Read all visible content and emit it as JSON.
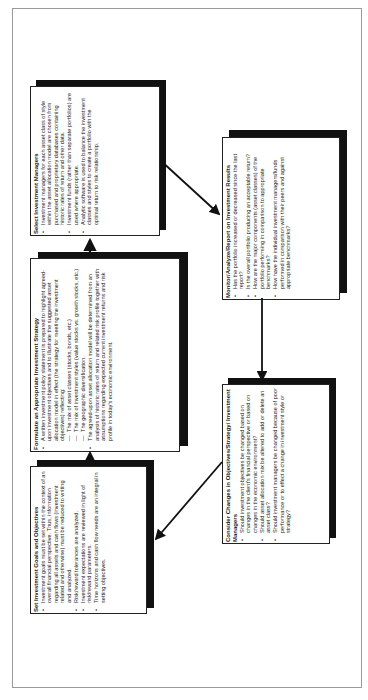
{
  "diagram": {
    "type": "investment-process-cycle",
    "boxes": {
      "select_managers": {
        "title": "Select Investment Managers",
        "bullets": [
          "Investment managers for each asset class of style within the asset allocation model are chosen from purchased and proprietary databases containing historic rates of return and other data.",
          "Investment funds (rather than separate portfolios) are used where appropriate.",
          "Analytic software is used to balance the investment classes and styles to create a portfolio with the optimal return to risk relationship."
        ]
      },
      "formulate_strategy": {
        "title": "Formulate an Appropriate Investment Strategy",
        "bullet1": "A written investment policy statement is prepared to highlight agreed-upon investment objectives and to illustrate the suggested asset allocation model in effect (the strategy for meeting the investment objectives) reflecting:",
        "sub_items": [
          "The mix of asset classes (stocks, bonds, etc.)",
          "The mix of investment styles (value stocks vs. growth stocks, etc.)",
          "The geographic diversification."
        ],
        "bullet2": "The agreed-upon asset allocation model will be determined from an analysis of historic rates of return and related risk profile together with assumptions regarding expected current investment returns and risk profile in today's economic environment."
      },
      "set_goals": {
        "title": "Set Investment Goals and Objectives",
        "bullets": [
          "Investment goals must be set within the context of an overall financial perspective. Thus, information regarding all assets and cash flows (investment related and otherwise) must be reduced to writing and analyzed.",
          "Risk/reward tolerances are analyzed.",
          "Investment expectations are reviewed in light of risk/reward parameters.",
          "Time horizons and cash flow needs are an integral in setting objectives."
        ]
      },
      "monitor": {
        "title": "Monitor/Analyze/Report on Investment Results",
        "bullets": [
          "Has the portfolio increased or decreased since the last report?",
          "Is the overall portfolio producing an acceptable return?",
          "How are the major components (asset classes) of the portfolio performing in comparison to appropriate benchmarks?",
          "How have the individual investment managers/funds performed in comparison with their peers and against appropriate benchmarks?"
        ]
      },
      "consider_changes": {
        "title": "Consider Changes in Objectives/Strategy/ Investment Managers",
        "bullets": [
          "Should investment objectives be changed based on changes in the client's financial perspective or based on changes in the economic environment?",
          "Should asset allocation mix be altered to add or delete an asset class?",
          "Should investment managers be changed because of poor performance or to effect a change in investment style or strategy?"
        ]
      }
    },
    "flow": [
      "Set Investment Goals and Objectives",
      "Formulate an Appropriate Investment Strategy",
      "Select Investment Managers",
      "Monitor/Analyze/Report on Investment Results",
      "Consider Changes in Objectives/Strategy/ Investment Managers",
      "Set Investment Goals and Objectives"
    ]
  }
}
